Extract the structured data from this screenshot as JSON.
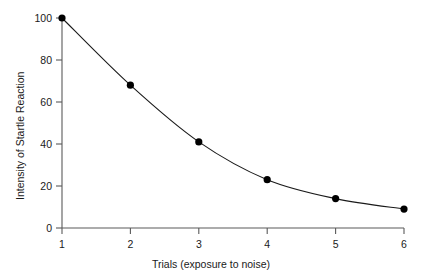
{
  "chart_data": {
    "type": "line",
    "title": "",
    "subtitle": "",
    "xlabel": "Trials (exposure to noise)",
    "ylabel": "Intensity of Startle Reaction",
    "x": [
      1,
      2,
      3,
      4,
      5,
      6
    ],
    "values": [
      100,
      68,
      41,
      23,
      14,
      9
    ],
    "series": [
      {
        "name": "Startle reaction",
        "values": [
          100,
          68,
          41,
          23,
          14,
          9
        ]
      }
    ],
    "xtick_labels": [
      "1",
      "2",
      "3",
      "4",
      "5",
      "6"
    ],
    "ytick_labels": [
      "0",
      "20",
      "40",
      "60",
      "80",
      "100"
    ],
    "ytick_values": [
      0,
      20,
      40,
      60,
      80,
      100
    ],
    "xlim": [
      1,
      6
    ],
    "ylim": [
      0,
      100
    ],
    "grid": false,
    "legend": "none",
    "marker": "filled-circle",
    "line_color": "#1a1a1a",
    "marker_color": "#000000",
    "axis_color": "#555555",
    "background_color": "#ffffff"
  }
}
